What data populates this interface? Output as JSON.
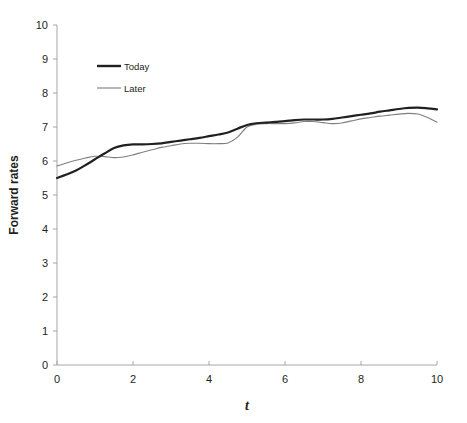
{
  "chart_data": {
    "type": "line",
    "title": "",
    "xlabel": "t",
    "ylabel": "Forward rates",
    "xlim": [
      0,
      10
    ],
    "ylim": [
      0,
      10
    ],
    "xticks": [
      0,
      2,
      4,
      6,
      8,
      10
    ],
    "xtick_labels": [
      "0",
      "2",
      "4",
      "6",
      "8",
      "10"
    ],
    "yticks": [
      0,
      1,
      2,
      3,
      4,
      5,
      6,
      7,
      8,
      9,
      10
    ],
    "ytick_labels": [
      "0",
      "1",
      "2",
      "3",
      "4",
      "5",
      "6",
      "7",
      "8",
      "9",
      "10"
    ],
    "grid": false,
    "legend_position": "upper-left-inside",
    "x": [
      0,
      0.25,
      0.5,
      0.75,
      1,
      1.25,
      1.5,
      1.75,
      2,
      2.25,
      2.5,
      2.75,
      3,
      3.25,
      3.5,
      3.75,
      4,
      4.25,
      4.5,
      4.75,
      5,
      5.25,
      5.5,
      5.75,
      6,
      6.25,
      6.5,
      6.75,
      7,
      7.25,
      7.5,
      7.75,
      8,
      8.25,
      8.5,
      8.75,
      9,
      9.25,
      9.5,
      9.75,
      10
    ],
    "series": [
      {
        "name": "Today",
        "color": "#231f20",
        "width": 2.2,
        "values": [
          5.5,
          5.6,
          5.72,
          5.88,
          6.05,
          6.22,
          6.38,
          6.46,
          6.49,
          6.49,
          6.5,
          6.52,
          6.56,
          6.6,
          6.64,
          6.68,
          6.73,
          6.78,
          6.84,
          6.95,
          7.06,
          7.11,
          7.13,
          7.15,
          7.17,
          7.2,
          7.22,
          7.22,
          7.22,
          7.24,
          7.28,
          7.32,
          7.36,
          7.4,
          7.45,
          7.49,
          7.53,
          7.56,
          7.57,
          7.55,
          7.52
        ]
      },
      {
        "name": "Later",
        "color": "#7f7f7f",
        "width": 1.1,
        "values": [
          5.85,
          5.94,
          6.02,
          6.09,
          6.14,
          6.13,
          6.1,
          6.12,
          6.18,
          6.26,
          6.33,
          6.4,
          6.45,
          6.5,
          6.52,
          6.52,
          6.51,
          6.51,
          6.53,
          6.7,
          7.0,
          7.08,
          7.1,
          7.1,
          7.1,
          7.12,
          7.16,
          7.16,
          7.13,
          7.1,
          7.12,
          7.18,
          7.24,
          7.28,
          7.32,
          7.35,
          7.38,
          7.4,
          7.38,
          7.28,
          7.14
        ]
      }
    ],
    "legend": [
      {
        "label": "Today",
        "color": "#231f20",
        "width": 2.4
      },
      {
        "label": "Later",
        "color": "#7f7f7f",
        "width": 1.1
      }
    ]
  },
  "geometry": {
    "plot_left": 57,
    "plot_right": 437,
    "plot_top": 25,
    "plot_bottom": 365,
    "legend_x": 97,
    "legend_y_first": 66,
    "legend_row_gap": 22,
    "legend_line_len": 24
  }
}
